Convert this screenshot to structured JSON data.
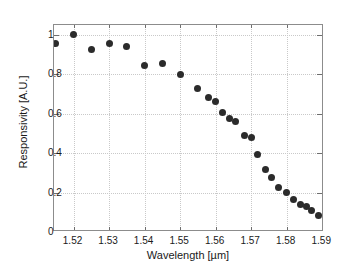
{
  "chart_data": {
    "type": "scatter",
    "title": "",
    "xlabel": "Wavelength [µm]",
    "ylabel": "Responsivity [A.U.]",
    "xlim": [
      1.5145,
      1.5905
    ],
    "ylim": [
      0,
      1.05
    ],
    "xticks": [
      1.52,
      1.53,
      1.54,
      1.55,
      1.56,
      1.57,
      1.58,
      1.59
    ],
    "xtick_labels": [
      "1.52",
      "1.53",
      "1.54",
      "1.55",
      "1.56",
      "1.57",
      "1.58",
      "1.59"
    ],
    "yticks": [
      0,
      0.2,
      0.4,
      0.6,
      0.8,
      1
    ],
    "ytick_labels": [
      "0",
      "0.2",
      "0.4",
      "0.6",
      "0.8",
      "1"
    ],
    "grid": true,
    "grid_style": "dotted",
    "legend": null,
    "marker": "filled-circle",
    "marker_color": "#2b2b2b",
    "series": [
      {
        "name": "Responsivity",
        "x": [
          1.515,
          1.52,
          1.525,
          1.53,
          1.535,
          1.54,
          1.545,
          1.55,
          1.555,
          1.558,
          1.56,
          1.562,
          1.564,
          1.5655,
          1.568,
          1.57,
          1.5718,
          1.574,
          1.5758,
          1.5778,
          1.58,
          1.582,
          1.584,
          1.5855,
          1.587,
          1.589
        ],
        "y": [
          0.955,
          1.0,
          0.925,
          0.955,
          0.94,
          0.845,
          0.855,
          0.8,
          0.728,
          0.682,
          0.66,
          0.605,
          0.575,
          0.558,
          0.487,
          0.48,
          0.395,
          0.317,
          0.278,
          0.225,
          0.2,
          0.165,
          0.14,
          0.128,
          0.11,
          0.086
        ]
      }
    ]
  },
  "figure": {
    "background_color": "#ffffff",
    "frame_color": "#8c8c8c",
    "grid_color": "#c9c9c9"
  }
}
